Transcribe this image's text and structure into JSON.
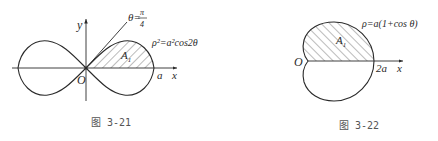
{
  "figures": [
    {
      "caption": "图 3-21",
      "curve_label": "ρ²=a²cos2θ",
      "angle_label_lhs": "θ=",
      "angle_frac_num": "π",
      "angle_frac_den": "4",
      "region_label": "A",
      "region_subscript": "1",
      "origin_label": "O",
      "x_axis_label": "x",
      "y_axis_label": "y",
      "x_intercept_label": "a"
    },
    {
      "caption": "图 3-22",
      "curve_label": "ρ=a(1+cos θ)",
      "region_label": "A",
      "region_subscript": "1",
      "origin_label": "O",
      "x_axis_label": "x",
      "x_intercept_label": "2a"
    }
  ],
  "colors": {
    "stroke": "#2a2a2a",
    "hatch": "#555555",
    "background": "#ffffff"
  }
}
